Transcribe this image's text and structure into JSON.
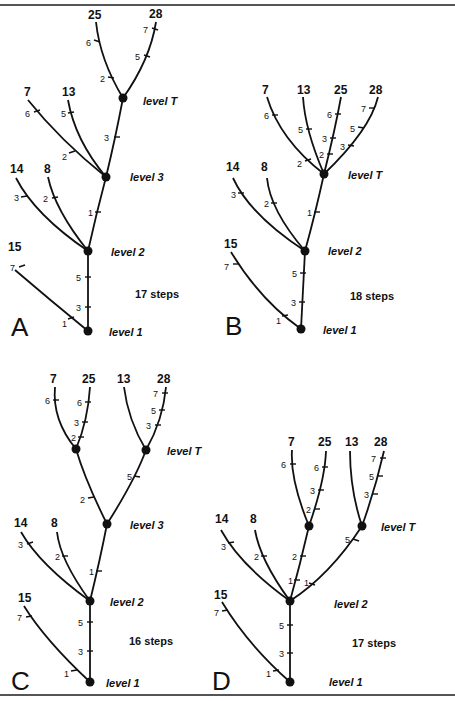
{
  "figure": {
    "panels": [
      {
        "letter": "A",
        "total": "17 steps",
        "levels": {
          "l1": "level 1",
          "l2": "level 2",
          "l3": "level 3",
          "lt": "level T"
        },
        "taxa": {
          "t25": "25",
          "t28": "28",
          "t7": "7",
          "t13": "13",
          "t14": "14",
          "t8": "8",
          "t15": "15"
        },
        "marks": [
          "6",
          "2",
          "7",
          "5",
          "6",
          "2",
          "5",
          "3",
          "3",
          "2",
          "1",
          "7",
          "1",
          "5",
          "3"
        ]
      },
      {
        "letter": "B",
        "total": "18 steps",
        "levels": {
          "l1": "level 1",
          "l2": "level 2",
          "lt": "level T"
        },
        "taxa": {
          "t7": "7",
          "t13": "13",
          "t25": "25",
          "t28": "28",
          "t14": "14",
          "t8": "8",
          "t15": "15"
        },
        "marks": [
          "6",
          "2",
          "5",
          "6",
          "3",
          "2",
          "7",
          "5",
          "3",
          "3",
          "2",
          "1",
          "7",
          "1",
          "5",
          "3"
        ]
      },
      {
        "letter": "C",
        "total": "16 steps",
        "levels": {
          "l1": "level 1",
          "l2": "level 2",
          "l3": "level 3",
          "lt": "level T"
        },
        "taxa": {
          "t7": "7",
          "t25": "25",
          "t13": "13",
          "t28": "28",
          "t14": "14",
          "t8": "8",
          "t15": "15"
        },
        "marks": [
          "6",
          "6",
          "3",
          "2",
          "7",
          "5",
          "3",
          "2",
          "5",
          "3",
          "2",
          "1",
          "7",
          "1",
          "5",
          "3"
        ]
      },
      {
        "letter": "D",
        "total": "17 steps",
        "levels": {
          "l1": "level 1",
          "l2": "level 2",
          "lt": "level T"
        },
        "taxa": {
          "t7": "7",
          "t25": "25",
          "t13": "13",
          "t28": "28",
          "t14": "14",
          "t8": "8",
          "t15": "15"
        },
        "marks": [
          "6",
          "6",
          "3",
          "2",
          "7",
          "5",
          "3",
          "2",
          "5",
          "1",
          "1",
          "3",
          "2",
          "7",
          "1",
          "5",
          "3"
        ]
      }
    ]
  }
}
